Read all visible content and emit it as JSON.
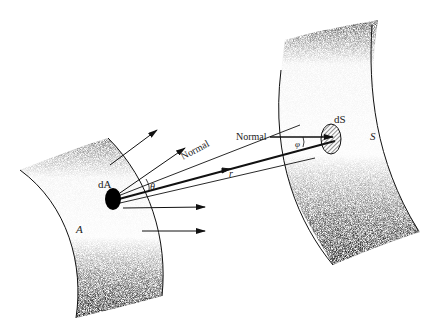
{
  "figure": {
    "type": "radiative view factor geometry",
    "surfaces": [
      {
        "id": "A",
        "label": "A",
        "element_label": "dA",
        "element_style": "filled"
      },
      {
        "id": "S",
        "label": "S",
        "element_label": "dS",
        "element_style": "hatched"
      }
    ],
    "labels": {
      "normal_at_dA": "Normal",
      "normal_at_dS": "Normal",
      "angle_at_dA": "θ",
      "angle_at_dS": "φ",
      "distance": "r",
      "dA": "dA",
      "dS": "dS",
      "surface_A": "A",
      "surface_S": "S"
    },
    "colors": {
      "ink": "#111111",
      "background": "#ffffff",
      "shade": "#000000"
    }
  }
}
